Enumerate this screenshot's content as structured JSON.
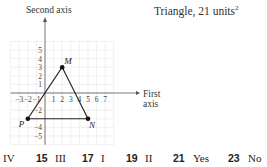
{
  "exercise_answer": {
    "title": "Triangle, 21 units",
    "title_superscript": "2"
  },
  "chart_data": {
    "type": "scatter",
    "xlabel": "First axis",
    "ylabel": "Second axis",
    "x_ticks": [
      -3,
      -2,
      -1,
      1,
      2,
      3,
      4,
      5,
      6,
      7
    ],
    "y_ticks": [
      5,
      4,
      3,
      2,
      1,
      -2,
      -4,
      -5
    ],
    "xlim": [
      -4,
      8
    ],
    "ylim": [
      -6,
      6
    ],
    "grid": true,
    "points": [
      {
        "label": "M",
        "x": 2,
        "y": 3
      },
      {
        "label": "N",
        "x": 5,
        "y": -3
      },
      {
        "label": "P",
        "x": -2,
        "y": -3
      }
    ],
    "polygon": [
      "M",
      "N",
      "P"
    ]
  },
  "axes": {
    "x_label_line1": "First",
    "x_label_line2": "axis",
    "y_label": "Second axis"
  },
  "answers": [
    {
      "number": "",
      "text": "IV"
    },
    {
      "number": "15",
      "text": "III"
    },
    {
      "number": "17",
      "text": "I"
    },
    {
      "number": "19",
      "text": "II"
    },
    {
      "number": "21",
      "text": "Yes"
    },
    {
      "number": "23",
      "text": "No"
    }
  ]
}
